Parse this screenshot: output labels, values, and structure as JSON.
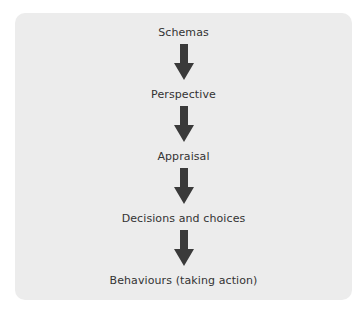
{
  "diagram": {
    "type": "vertical-flow",
    "steps": [
      {
        "label": "Schemas"
      },
      {
        "label": "Perspective"
      },
      {
        "label": "Appraisal"
      },
      {
        "label": "Decisions and choices"
      },
      {
        "label": "Behaviours (taking action)"
      }
    ],
    "arrow_color": "#3a3a3a",
    "panel_color": "#ececec",
    "text_color": "#333333"
  }
}
